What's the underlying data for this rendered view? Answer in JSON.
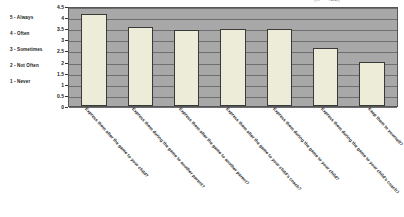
{
  "title_clipped": "(n = 422)",
  "legend": {
    "items": [
      {
        "label": "5 - Always"
      },
      {
        "label": "4 - Often"
      },
      {
        "label": "3 - Sometimes"
      },
      {
        "label": "2 - Not Often"
      },
      {
        "label": "1 - Never"
      }
    ]
  },
  "chart_data": {
    "type": "bar",
    "title": "",
    "xlabel": "",
    "ylabel": "",
    "ylim": [
      0,
      4.5
    ],
    "yticks": [
      0,
      0.5,
      1,
      1.5,
      2,
      2.5,
      3,
      3.5,
      4,
      4.5
    ],
    "ytick_labels": [
      "0",
      "0.5",
      "1",
      "1.5",
      "2",
      "2.5",
      "3",
      "3.5",
      "4",
      "4.5"
    ],
    "grid": true,
    "legend_position": "left",
    "categories": [
      "Express them after the game to your child?",
      "Express them during the game to another parent?",
      "Express them after the game to another parent?",
      "Express them after the game to your child's coach?",
      "Express them during the game to your child?",
      "Express them during the game to your child's coach?",
      "Keep them to yourself?"
    ],
    "values": [
      4.15,
      3.55,
      3.4,
      3.45,
      3.45,
      2.6,
      2.0
    ],
    "colors": {
      "bar_fill": "#ececd8",
      "bar_border": "#3a3a3a",
      "plot_background": "#a8a8a8",
      "gridline": "#6e6e6e",
      "text": "#1a1a1a"
    }
  }
}
